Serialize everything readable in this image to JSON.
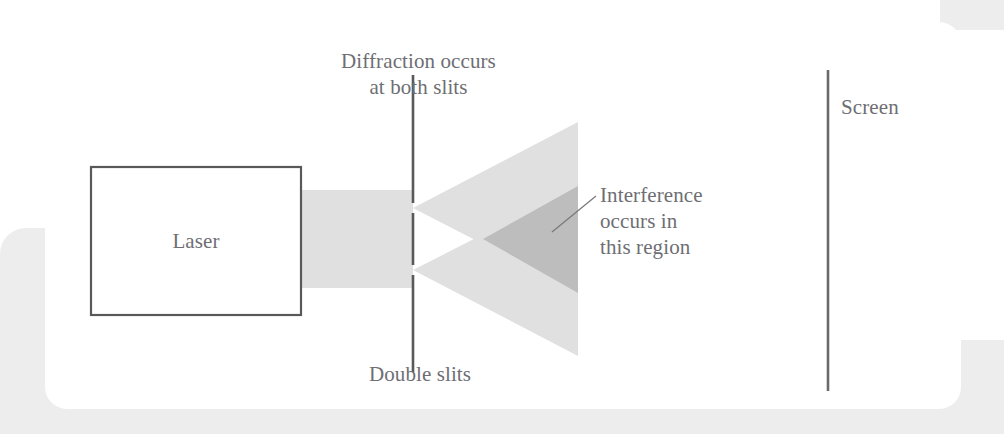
{
  "figure": {
    "background_color": "#ffffff",
    "card_color": "#ffffff",
    "backdrop_color": "#ededee",
    "text_color": "#6e6e73",
    "stroke_color": "#595959",
    "beam_color": "#e0e0e0",
    "cone_color": "#e0e0e0",
    "overlap_color": "#bdbdbd"
  },
  "labels": {
    "diffraction": "Diffraction occurs\nat both slits",
    "double_slits": "Double slits",
    "laser": "Laser",
    "interference": "Interference\noccurs in\nthis region",
    "screen": "Screen"
  },
  "geometry": {
    "laser_box": {
      "x": 91,
      "y": 167,
      "width": 210,
      "height": 148
    },
    "beam": {
      "x": 297,
      "y": 190,
      "width": 116,
      "height": 98
    },
    "barrier": {
      "x": 413,
      "y_top": 75,
      "y_bottom": 372
    },
    "slits": [
      {
        "name": "upper-slit",
        "y_top": 203,
        "y_bottom": 213
      },
      {
        "name": "lower-slit",
        "y_top": 265,
        "y_bottom": 275
      }
    ],
    "cones": [
      {
        "name": "upper-cone",
        "apex_x": 413,
        "apex_y": 208,
        "end_x": 578,
        "end_y_top": 122,
        "end_y_bottom": 293
      },
      {
        "name": "lower-cone",
        "apex_x": 413,
        "apex_y": 270,
        "end_x": 578,
        "end_y_top": 186,
        "end_y_bottom": 356
      }
    ],
    "overlap": {
      "start_x": 483,
      "end_x": 578,
      "end_y_top": 186,
      "end_y_bottom": 293
    },
    "screen": {
      "x": 828,
      "y_top": 70,
      "y_bottom": 391
    },
    "leader_line": {
      "x1": 552,
      "y1": 232,
      "x2": 596,
      "y2": 196
    }
  }
}
